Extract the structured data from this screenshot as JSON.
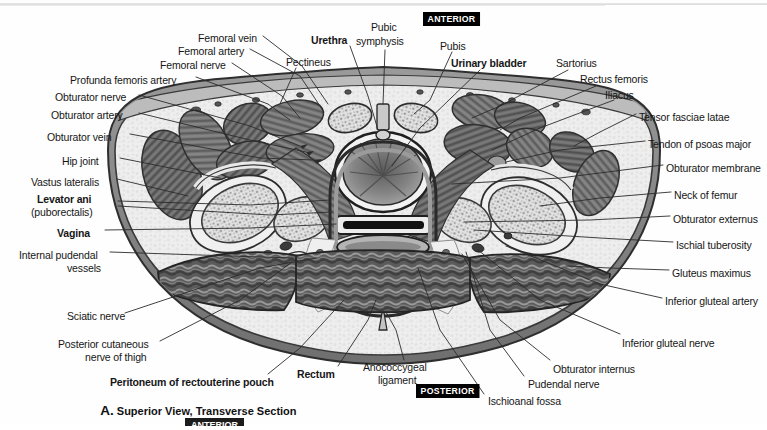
{
  "figure": {
    "caption_letter": "A.",
    "caption_text": " Superior View, Transverse Section",
    "orientation_top": "ANTERIOR",
    "orientation_bottom": "POSTERIOR",
    "bottom_clipped_badge": "ANTERIOR"
  },
  "colors": {
    "page_background": "#fefefe",
    "skin_outline": "#4a4a4a",
    "fat_light": "#ececec",
    "muscle_dark": "#6e6e6e",
    "muscle_darkest": "#3b3b3b",
    "bone_marrow": "#dcdcdc",
    "lumen_black": "#111111",
    "badge_background": "#000000",
    "badge_text": "#ffffff",
    "label_text": "#161616",
    "leader_line": "#2b2b2b"
  },
  "labels_left": [
    {
      "text": "Femoral vein",
      "bold": false,
      "x": 198,
      "y": 33
    },
    {
      "text": "Femoral artery",
      "bold": false,
      "x": 178,
      "y": 46
    },
    {
      "text": "Femoral nerve",
      "bold": false,
      "x": 160,
      "y": 60
    },
    {
      "text": "Profunda femoris artery",
      "bold": false,
      "x": 70,
      "y": 75
    },
    {
      "text": "Obturator nerve",
      "bold": false,
      "x": 55,
      "y": 92
    },
    {
      "text": "Obturator artery",
      "bold": false,
      "x": 51,
      "y": 110
    },
    {
      "text": "Obturator vein",
      "bold": false,
      "x": 47,
      "y": 132
    },
    {
      "text": "Hip joint",
      "bold": false,
      "x": 62,
      "y": 156
    },
    {
      "text": "Vastus lateralis",
      "bold": false,
      "x": 31,
      "y": 177
    },
    {
      "text": "Levator ani",
      "bold": true,
      "x": 37,
      "y": 194
    },
    {
      "text": "(puborectalis)",
      "bold": false,
      "x": 31,
      "y": 207
    },
    {
      "text": "Vagina",
      "bold": true,
      "x": 57,
      "y": 228
    },
    {
      "text": "Internal pudendal",
      "bold": false,
      "x": 19,
      "y": 250
    },
    {
      "text": "vessels",
      "bold": false,
      "x": 67,
      "y": 263
    },
    {
      "text": "Sciatic nerve",
      "bold": false,
      "x": 67,
      "y": 311
    },
    {
      "text": "Posterior cutaneous",
      "bold": false,
      "x": 58,
      "y": 339
    },
    {
      "text": "nerve of thigh",
      "bold": false,
      "x": 85,
      "y": 352
    }
  ],
  "labels_top": [
    {
      "text": "Pectineus",
      "bold": false,
      "x": 286,
      "y": 57
    },
    {
      "text": "Urethra",
      "bold": true,
      "x": 311,
      "y": 35
    },
    {
      "text": "Pubic",
      "bold": false,
      "x": 371,
      "y": 22
    },
    {
      "text": "symphysis",
      "bold": false,
      "x": 356,
      "y": 36
    },
    {
      "text": "Pubis",
      "bold": false,
      "x": 440,
      "y": 41
    },
    {
      "text": "Urinary bladder",
      "bold": true,
      "x": 451,
      "y": 58
    },
    {
      "text": "Sartorius",
      "bold": false,
      "x": 556,
      "y": 58
    },
    {
      "text": "Rectus femoris",
      "bold": false,
      "x": 580,
      "y": 74
    },
    {
      "text": "Iliacus",
      "bold": false,
      "x": 605,
      "y": 90
    }
  ],
  "labels_right": [
    {
      "text": "Tensor fasciae latae",
      "bold": false,
      "x": 639,
      "y": 112
    },
    {
      "text": "Tendon of psoas major",
      "bold": false,
      "x": 648,
      "y": 139
    },
    {
      "text": "Obturator membrane",
      "bold": false,
      "x": 666,
      "y": 163
    },
    {
      "text": "Neck of femur",
      "bold": false,
      "x": 674,
      "y": 190
    },
    {
      "text": "Obturator externus",
      "bold": false,
      "x": 673,
      "y": 214
    },
    {
      "text": "Ischial tuberosity",
      "bold": false,
      "x": 676,
      "y": 240
    },
    {
      "text": "Gluteus maximus",
      "bold": false,
      "x": 672,
      "y": 268
    },
    {
      "text": "Inferior gluteal artery",
      "bold": false,
      "x": 665,
      "y": 296
    },
    {
      "text": "Inferior gluteal nerve",
      "bold": false,
      "x": 622,
      "y": 338
    }
  ],
  "labels_bottom": [
    {
      "text": "Peritoneum of rectouterine pouch",
      "bold": true,
      "x": 110,
      "y": 377
    },
    {
      "text": "Rectum",
      "bold": true,
      "x": 297,
      "y": 369
    },
    {
      "text": "Anococcygeal",
      "bold": false,
      "x": 363,
      "y": 362
    },
    {
      "text": "ligament",
      "bold": false,
      "x": 378,
      "y": 375
    },
    {
      "text": "Obturator internus",
      "bold": false,
      "x": 553,
      "y": 364
    },
    {
      "text": "Pudendal nerve",
      "bold": false,
      "x": 528,
      "y": 379
    },
    {
      "text": "Ischioanal fossa",
      "bold": false,
      "x": 488,
      "y": 396
    }
  ]
}
